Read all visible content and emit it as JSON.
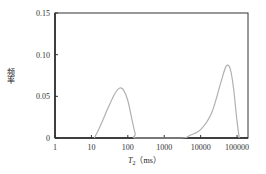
{
  "chart_data": {
    "type": "line",
    "title": "",
    "xlabel": "T2 (ms)",
    "xlabel_main": "T",
    "xlabel_sub": "2",
    "xlabel_unit": "（ms）",
    "ylabel": "频率",
    "xscale": "log",
    "xlim": [
      1,
      200000
    ],
    "ylim": [
      0,
      0.15
    ],
    "x_ticks": [
      "1",
      "10",
      "100",
      "1000",
      "10000",
      "100000"
    ],
    "y_ticks": [
      "0",
      "0.05",
      "0.10",
      "0.15"
    ],
    "grid": false,
    "legend": null,
    "series": [
      {
        "name": "T2 spectrum",
        "color": "#b0b0b0",
        "points": [
          [
            12,
            0.0
          ],
          [
            15,
            0.008
          ],
          [
            20,
            0.02
          ],
          [
            30,
            0.038
          ],
          [
            45,
            0.054
          ],
          [
            60,
            0.06
          ],
          [
            75,
            0.058
          ],
          [
            100,
            0.045
          ],
          [
            130,
            0.022
          ],
          [
            160,
            0.005
          ],
          [
            180,
            0.0
          ],
          [
            3000,
            0.0
          ],
          [
            5000,
            0.003
          ],
          [
            10000,
            0.01
          ],
          [
            20000,
            0.03
          ],
          [
            35000,
            0.065
          ],
          [
            50000,
            0.086
          ],
          [
            65000,
            0.083
          ],
          [
            80000,
            0.06
          ],
          [
            100000,
            0.02
          ],
          [
            115000,
            0.0
          ]
        ]
      }
    ]
  }
}
